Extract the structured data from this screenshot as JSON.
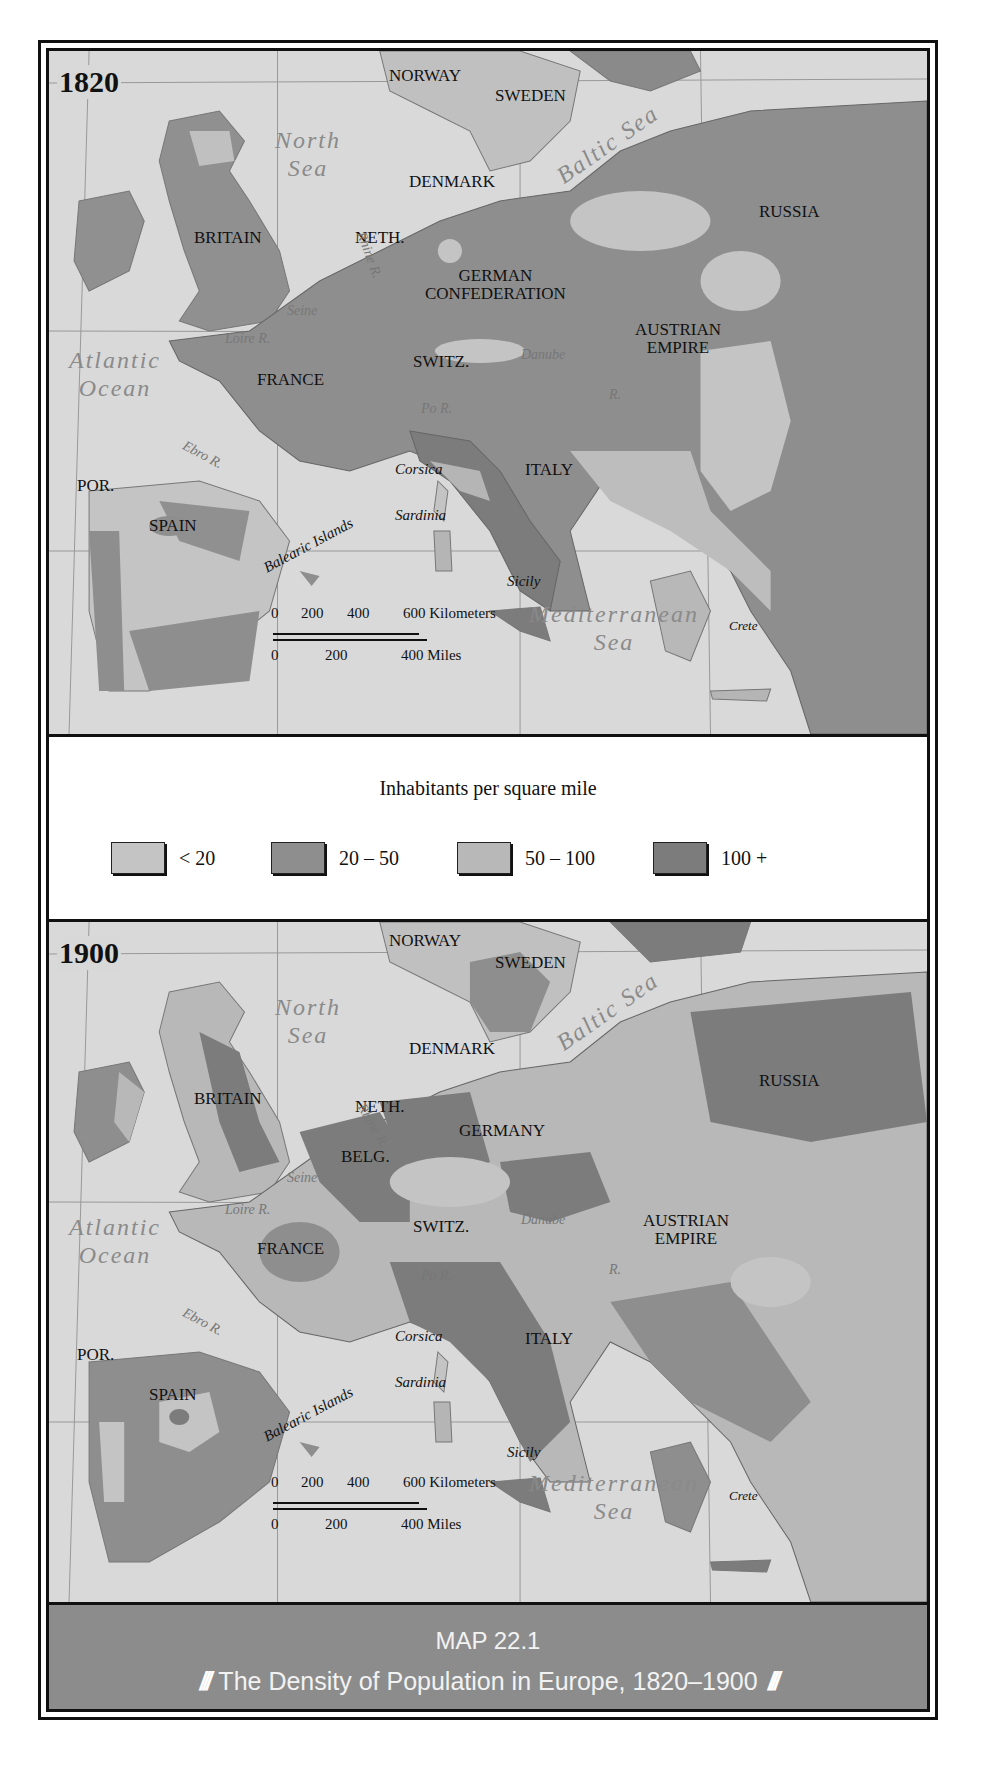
{
  "legend": {
    "title": "Inhabitants per square mile",
    "items": [
      {
        "label": "< 20",
        "color": "#c4c4c4"
      },
      {
        "label": "20 – 50",
        "color": "#8e8e8e"
      },
      {
        "label": "50 – 100",
        "color": "#b8b8b8"
      },
      {
        "label": "100 +",
        "color": "#7c7c7c"
      }
    ]
  },
  "colors": {
    "sea": "#d9d9d9",
    "land_low": "#c4c4c4",
    "land_20_50": "#8e8e8e",
    "land_50_100": "#b8b8b8",
    "land_100": "#7c7c7c",
    "caption_bg": "#8c8c8c"
  },
  "maps": [
    {
      "year": "1820",
      "countries": [
        "NORWAY",
        "SWEDEN",
        "DENMARK",
        "RUSSIA",
        "BRITAIN",
        "NETH.",
        "GERMAN CONFEDERATION",
        "AUSTRIAN EMPIRE",
        "FRANCE",
        "SWITZ.",
        "ITALY",
        "POR.",
        "SPAIN"
      ],
      "seas": [
        "North Sea",
        "Baltic Sea",
        "Atlantic Ocean",
        "Mediterranean Sea"
      ],
      "islands": [
        "Corsica",
        "Sardinia",
        "Balearic Islands",
        "Sicily",
        "Crete"
      ],
      "rivers": [
        "Rhine R.",
        "Seine R.",
        "Loire R.",
        "Danube",
        "Po R.",
        "Ebro R.",
        "R."
      ]
    },
    {
      "year": "1900",
      "countries": [
        "NORWAY",
        "SWEDEN",
        "DENMARK",
        "RUSSIA",
        "BRITAIN",
        "NETH.",
        "BELG.",
        "GERMANY",
        "AUSTRIAN EMPIRE",
        "FRANCE",
        "SWITZ.",
        "ITALY",
        "POR.",
        "SPAIN"
      ],
      "seas": [
        "North Sea",
        "Baltic Sea",
        "Atlantic Ocean",
        "Mediterranean Sea"
      ],
      "islands": [
        "Corsica",
        "Sardinia",
        "Balearic Islands",
        "Sicily",
        "Crete"
      ],
      "rivers": [
        "Rhine R.",
        "Seine R.",
        "Loire R.",
        "Danube",
        "Po R.",
        "Ebro R.",
        "R."
      ]
    }
  ],
  "labels": {
    "norway": "NORWAY",
    "sweden": "SWEDEN",
    "denmark": "DENMARK",
    "russia": "RUSSIA",
    "britain": "BRITAIN",
    "neth": "NETH.",
    "belg": "BELG.",
    "german_conf_1": "GERMAN",
    "german_conf_2": "CONFEDERATION",
    "germany": "GERMANY",
    "austrian_1": "AUSTRIAN",
    "austrian_2": "EMPIRE",
    "france": "FRANCE",
    "switz": "SWITZ.",
    "italy": "ITALY",
    "por": "POR.",
    "spain": "SPAIN",
    "north_sea_1": "North",
    "north_sea_2": "Sea",
    "baltic": "Baltic Sea",
    "atlantic_1": "Atlantic",
    "atlantic_2": "Ocean",
    "med_1": "Mediterranean",
    "med_2": "Sea",
    "corsica": "Corsica",
    "sardinia": "Sardinia",
    "balearic": "Balearic Islands",
    "sicily": "Sicily",
    "crete": "Crete",
    "rhine": "Rhine R.",
    "seine": "Seine",
    "seine_r": "R.",
    "loire": "Loire R.",
    "danube": "Danube",
    "po": "Po R.",
    "ebro": "Ebro R.",
    "r": "R."
  },
  "scale": {
    "km_ticks": [
      "0",
      "200",
      "400",
      "600 Kilometers"
    ],
    "mi_ticks": [
      "0",
      "200",
      "400 Miles"
    ]
  },
  "caption": {
    "title": "MAP 22.1",
    "subtitle": "The Density of Population in Europe, 1820–1900",
    "ornament": "///"
  }
}
